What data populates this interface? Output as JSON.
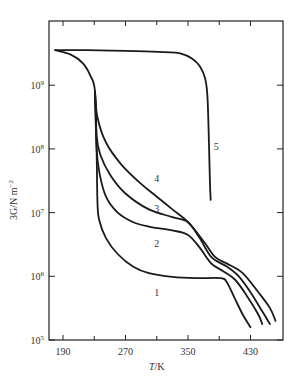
{
  "chart_data": {
    "type": "line",
    "title": "",
    "xlabel": "T/K",
    "ylabel": "3G/N m^-2",
    "xlim": [
      172,
      472
    ],
    "ylim_log10": [
      5,
      9.85
    ],
    "yscale": "log",
    "grid": false,
    "x_ticks": [
      190,
      270,
      350,
      430
    ],
    "x_minor_ticks": [
      230,
      310,
      390
    ],
    "y_ticks": [
      "10^5",
      "10^6",
      "10^7",
      "10^8",
      "10^9"
    ],
    "y_tick_values_log10": [
      5,
      6,
      7,
      8,
      9
    ],
    "series": [
      {
        "name": "1",
        "label_pos": {
          "T": 310,
          "log10G": 5.75
        },
        "points": [
          [
            180,
            9.55
          ],
          [
            200,
            9.48
          ],
          [
            215,
            9.35
          ],
          [
            225,
            9.15
          ],
          [
            231,
            8.9
          ],
          [
            233,
            8.0
          ],
          [
            234,
            7.2
          ],
          [
            236,
            6.9
          ],
          [
            245,
            6.6
          ],
          [
            260,
            6.35
          ],
          [
            280,
            6.15
          ],
          [
            300,
            6.05
          ],
          [
            330,
            5.99
          ],
          [
            360,
            5.97
          ],
          [
            392,
            5.97
          ],
          [
            400,
            5.9
          ],
          [
            410,
            5.65
          ],
          [
            420,
            5.4
          ],
          [
            430,
            5.2
          ]
        ]
      },
      {
        "name": "2",
        "label_pos": {
          "T": 310,
          "log10G": 6.52
        },
        "points": [
          [
            231,
            8.9
          ],
          [
            233,
            8.0
          ],
          [
            237,
            7.6
          ],
          [
            245,
            7.25
          ],
          [
            260,
            7.0
          ],
          [
            280,
            6.85
          ],
          [
            300,
            6.78
          ],
          [
            330,
            6.72
          ],
          [
            350,
            6.65
          ],
          [
            365,
            6.45
          ],
          [
            380,
            6.2
          ],
          [
            395,
            6.08
          ],
          [
            410,
            5.95
          ],
          [
            425,
            5.7
          ],
          [
            440,
            5.4
          ],
          [
            445,
            5.25
          ]
        ]
      },
      {
        "name": "3",
        "label_pos": {
          "T": 310,
          "log10G": 7.07
        },
        "points": [
          [
            231,
            8.9
          ],
          [
            233,
            8.2
          ],
          [
            238,
            7.9
          ],
          [
            250,
            7.6
          ],
          [
            270,
            7.3
          ],
          [
            300,
            7.05
          ],
          [
            330,
            6.93
          ],
          [
            350,
            6.85
          ],
          [
            365,
            6.6
          ],
          [
            380,
            6.3
          ],
          [
            400,
            6.15
          ],
          [
            415,
            6.0
          ],
          [
            430,
            5.75
          ],
          [
            445,
            5.45
          ],
          [
            455,
            5.25
          ]
        ]
      },
      {
        "name": "4",
        "label_pos": {
          "T": 310,
          "log10G": 7.55
        },
        "points": [
          [
            231,
            8.9
          ],
          [
            234,
            8.5
          ],
          [
            245,
            8.1
          ],
          [
            265,
            7.75
          ],
          [
            290,
            7.45
          ],
          [
            310,
            7.25
          ],
          [
            330,
            7.05
          ],
          [
            350,
            6.85
          ],
          [
            370,
            6.55
          ],
          [
            385,
            6.3
          ],
          [
            400,
            6.2
          ],
          [
            420,
            6.05
          ],
          [
            440,
            5.75
          ],
          [
            455,
            5.5
          ],
          [
            462,
            5.3
          ]
        ]
      },
      {
        "name": "5",
        "label_pos": {
          "T": 386,
          "log10G": 8.05
        },
        "points": [
          [
            180,
            9.55
          ],
          [
            220,
            9.55
          ],
          [
            270,
            9.54
          ],
          [
            320,
            9.52
          ],
          [
            340,
            9.5
          ],
          [
            355,
            9.42
          ],
          [
            365,
            9.3
          ],
          [
            372,
            9.1
          ],
          [
            375,
            8.8
          ],
          [
            377,
            8.0
          ],
          [
            378,
            7.5
          ],
          [
            379,
            7.2
          ]
        ]
      }
    ]
  },
  "axes": {
    "xlabel_italic": "T",
    "xlabel_unit": "/K",
    "ylabel_text": "3G/N m",
    "ylabel_exp": "−2",
    "x_tick_labels": [
      "190",
      "270",
      "350",
      "430"
    ],
    "y_tick_labels": [
      {
        "base": "10",
        "exp": "5"
      },
      {
        "base": "10",
        "exp": "6"
      },
      {
        "base": "10",
        "exp": "7"
      },
      {
        "base": "10",
        "exp": "8"
      },
      {
        "base": "10",
        "exp": "9"
      }
    ]
  },
  "colors": {
    "line": "#1a1a1a",
    "axis": "#222222",
    "background": "#ffffff"
  }
}
